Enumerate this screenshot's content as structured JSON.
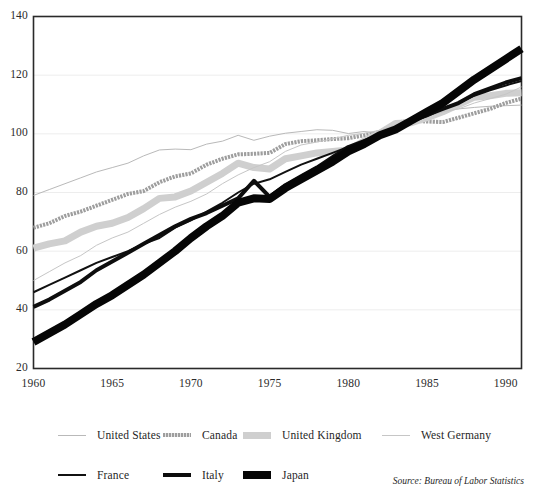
{
  "chart_data": {
    "type": "line",
    "title": "",
    "subtitle": "",
    "xlabel": "",
    "ylabel": "",
    "xlim": [
      1960,
      1991
    ],
    "ylim": [
      20,
      140
    ],
    "grid": true,
    "grid_axis": "y",
    "legend_position": "below",
    "x_ticks": [
      "1960",
      "1965",
      "1970",
      "1975",
      "1980",
      "1985",
      "1990"
    ],
    "x_tick_values": [
      1960,
      1965,
      1970,
      1975,
      1980,
      1985,
      1990
    ],
    "y_ticks": [
      "20",
      "40",
      "60",
      "80",
      "100",
      "120",
      "140"
    ],
    "y_tick_values": [
      20,
      40,
      60,
      80,
      100,
      120,
      140
    ],
    "x": [
      1960,
      1961,
      1962,
      1963,
      1964,
      1965,
      1966,
      1967,
      1968,
      1969,
      1970,
      1971,
      1972,
      1973,
      1974,
      1975,
      1976,
      1977,
      1978,
      1979,
      1980,
      1981,
      1982,
      1983,
      1984,
      1985,
      1986,
      1987,
      1988,
      1989,
      1990,
      1991
    ],
    "annotations": [
      "Source: Bureau of Labor Statistics"
    ],
    "series": [
      {
        "name": "United States",
        "style": "thin-gray",
        "color": "#b9b9b9",
        "width": 1,
        "values": [
          79,
          81,
          83,
          85,
          87,
          88.5,
          90,
          92.5,
          94.5,
          94.8,
          94.6,
          96.5,
          97.5,
          99.5,
          97.8,
          99.2,
          100.2,
          100.8,
          101.4,
          101.2,
          100.1,
          100.8,
          100.2,
          103.2,
          105.4,
          106.8,
          108.2,
          108.5,
          109,
          109.4,
          109.6,
          109.8
        ]
      },
      {
        "name": "Canada",
        "style": "dotted-gray",
        "color": "#9e9e9e",
        "width": 4,
        "values": [
          68,
          69.5,
          72,
          73.5,
          75.5,
          77.5,
          79.5,
          80.5,
          83.5,
          85.5,
          86.5,
          89.5,
          91.5,
          93,
          93.2,
          93.5,
          96.5,
          97.5,
          97.8,
          98.2,
          98.5,
          99.5,
          100.6,
          103.8,
          104.5,
          104.2,
          104,
          105.5,
          107,
          108.5,
          110.5,
          112
        ]
      },
      {
        "name": "United Kingdom",
        "style": "thick-gray",
        "color": "#cfcfcf",
        "width": 7,
        "values": [
          61,
          62.5,
          63.5,
          66.5,
          68.5,
          69.5,
          71.5,
          74.5,
          78,
          78.5,
          80.5,
          83.5,
          86.5,
          90,
          88.5,
          88,
          91.5,
          92.5,
          93.5,
          94,
          94.5,
          97.5,
          100.2,
          103.5,
          103.8,
          105.5,
          107.5,
          110,
          112.5,
          113,
          113.8,
          114
        ]
      },
      {
        "name": "West Germany",
        "style": "thin-gray",
        "color": "#c6c6c6",
        "width": 1,
        "values": [
          50,
          53,
          56,
          58.5,
          62,
          64.5,
          66.5,
          69.5,
          72.5,
          75,
          77,
          79.5,
          83,
          86,
          88.5,
          90.5,
          94,
          96.2,
          97.2,
          98.3,
          99.5,
          100.2,
          101.2,
          103,
          104.5,
          106,
          107.5,
          108.5,
          110.5,
          112,
          113.5,
          116
        ]
      },
      {
        "name": "France",
        "style": "thin-black",
        "color": "#111111",
        "width": 2,
        "values": [
          46,
          48.5,
          51,
          53.5,
          56,
          58,
          60,
          62.5,
          64.5,
          68,
          70.5,
          73.5,
          76.5,
          80,
          83,
          84.5,
          87,
          89.5,
          91.5,
          93.5,
          95.5,
          97.5,
          99.8,
          102,
          104,
          106,
          108.5,
          110.5,
          113,
          114.8,
          116.5,
          118
        ]
      },
      {
        "name": "Italy",
        "style": "medium-black",
        "color": "#0d0d0d",
        "width": 4,
        "values": [
          41,
          43.5,
          46.5,
          49.5,
          53.5,
          56.5,
          59.5,
          62.5,
          65.5,
          68.5,
          71,
          73,
          75.5,
          78,
          84,
          78.5,
          82.5,
          85.5,
          88.5,
          92,
          95.5,
          97.5,
          99.5,
          101.5,
          104.5,
          106.5,
          108.5,
          110.5,
          113.5,
          115.5,
          117.5,
          119
        ]
      },
      {
        "name": "Japan",
        "style": "thick-black",
        "color": "#060606",
        "width": 8,
        "values": [
          29,
          32,
          35,
          38.5,
          42,
          45,
          48.5,
          52,
          56,
          60,
          64.5,
          68.5,
          72,
          76.5,
          78,
          77.8,
          81.5,
          84.5,
          87.5,
          90.5,
          94,
          96.5,
          99.5,
          101.5,
          104.5,
          107.5,
          110.5,
          114.5,
          118.5,
          122,
          125.5,
          129
        ]
      }
    ]
  },
  "legend": {
    "row1": [
      {
        "label": "United States",
        "swatch": "sw-thin-gray"
      },
      {
        "label": "Canada",
        "swatch": "sw-dot-gray"
      },
      {
        "label": "United Kingdom",
        "swatch": "sw-thick-gray"
      },
      {
        "label": "West Germany",
        "swatch": "sw-thin-gray2"
      }
    ],
    "row2": [
      {
        "label": "France",
        "swatch": "sw-thin-black"
      },
      {
        "label": "Italy",
        "swatch": "sw-med-black"
      },
      {
        "label": "Japan",
        "swatch": "sw-thick-black"
      }
    ]
  },
  "source_note": "Source: Bureau of Labor Statistics",
  "colors": {
    "frame": "#2a2a2a",
    "gridline": "#ededed",
    "background": "#ffffff",
    "text": "#1f1f1f"
  }
}
